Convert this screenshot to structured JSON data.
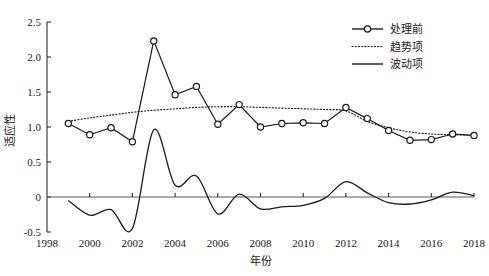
{
  "chart_data": {
    "type": "line",
    "title": "",
    "xlabel": "年份",
    "ylabel": "适应性",
    "xlim": [
      1998,
      2018
    ],
    "ylim": [
      -0.5,
      2.5
    ],
    "xticks": [
      1998,
      2000,
      2002,
      2004,
      2006,
      2008,
      2010,
      2012,
      2014,
      2016,
      2018
    ],
    "xticklabels": [
      "1998",
      "2000",
      "2002",
      "2004",
      "2006",
      "2008",
      "2010",
      "2012",
      "2014",
      "2016",
      "2018"
    ],
    "yticks": [
      -0.5,
      0,
      0.5,
      1.0,
      1.5,
      2.0,
      2.5
    ],
    "yticklabels": [
      "-0.5",
      "0",
      "0.5",
      "1.0",
      "1.5",
      "2.0",
      "2.5"
    ],
    "grid": false,
    "legend_position": "top-right",
    "x": [
      1999,
      2000,
      2001,
      2002,
      2003,
      2004,
      2005,
      2006,
      2007,
      2008,
      2009,
      2010,
      2011,
      2012,
      2013,
      2014,
      2015,
      2016,
      2017,
      2018
    ],
    "series": [
      {
        "name": "处理前",
        "style": "solid-with-circle-markers",
        "values": [
          1.05,
          0.89,
          0.99,
          0.79,
          2.23,
          1.46,
          1.58,
          1.04,
          1.32,
          1.0,
          1.05,
          1.06,
          1.05,
          1.28,
          1.12,
          0.95,
          0.81,
          0.82,
          0.9,
          0.88
        ]
      },
      {
        "name": "趋势项",
        "style": "dotted",
        "values": [
          1.08,
          1.13,
          1.17,
          1.21,
          1.24,
          1.26,
          1.28,
          1.29,
          1.29,
          1.28,
          1.27,
          1.26,
          1.25,
          1.23,
          1.08,
          0.99,
          0.93,
          0.9,
          0.89,
          0.88
        ]
      },
      {
        "name": "波动项",
        "style": "solid-smooth",
        "values": [
          -0.05,
          -0.26,
          -0.18,
          -0.45,
          0.96,
          0.17,
          0.3,
          -0.24,
          0.04,
          -0.17,
          -0.14,
          -0.12,
          -0.02,
          0.22,
          0.06,
          -0.08,
          -0.1,
          -0.04,
          0.07,
          0.02
        ]
      }
    ],
    "legend": [
      {
        "label": "处理前",
        "marker": "circle",
        "line": "solid"
      },
      {
        "label": "趋势项",
        "marker": "none",
        "line": "dotted"
      },
      {
        "label": "波动项",
        "marker": "none",
        "line": "solid"
      }
    ],
    "colors": {
      "axis": "#1a1a1a",
      "observed": "#1a1a1a",
      "trend": "#1a1a1a",
      "wave": "#1a1a1a",
      "background": "#ffffff"
    }
  }
}
